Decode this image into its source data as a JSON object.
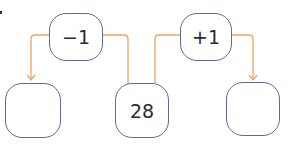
{
  "colors": {
    "connector": "#f2a15f",
    "box_border": "#5d6b8f",
    "text": "#2b2b2b"
  },
  "operations": [
    {
      "label": "−1"
    },
    {
      "label": "+1"
    }
  ],
  "values": [
    {
      "label": ""
    },
    {
      "label": "28"
    },
    {
      "label": ""
    }
  ]
}
